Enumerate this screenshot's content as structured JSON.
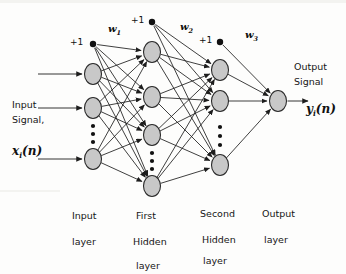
{
  "diagram": {
    "background_color": "#fdfdfc",
    "node_fill": "#c8c8c8",
    "node_stroke": "#2b2b2b",
    "edge_color": "#1d1d1d"
  },
  "signals": {
    "input_line1": "Input",
    "input_line2": "Signal,",
    "input_math": "x",
    "input_math_sub": "i",
    "input_math_tail": "(n)",
    "output_line1": "Output",
    "output_line2": "Signal",
    "output_math": "y",
    "output_math_sub": "i",
    "output_math_tail": "(n)"
  },
  "bias": {
    "input_layer": "+1",
    "first_hidden_layer": "+1",
    "second_hidden_layer": "+1"
  },
  "weights": [
    {
      "name": "w",
      "sub": "1"
    },
    {
      "name": "w",
      "sub": "2"
    },
    {
      "name": "w",
      "sub": "3"
    }
  ],
  "layer_captions": [
    {
      "line1": "Input",
      "line2": "layer",
      "line3": ""
    },
    {
      "line1": "First",
      "line2": "Hidden",
      "line3": "layer"
    },
    {
      "line1": "Second",
      "line2": "Hidden",
      "line3": "layer"
    },
    {
      "line1": "Output",
      "line2": "layer",
      "line3": ""
    }
  ],
  "layers": [
    {
      "id": "input-layer",
      "x": 93,
      "node_count": 3,
      "node_y": [
        74,
        108,
        159
      ],
      "bias_y": 44,
      "ellipsis_y": [
        126,
        134,
        142
      ],
      "has_bias": true
    },
    {
      "id": "first-hidden-layer",
      "x": 152,
      "node_count": 4,
      "node_y": [
        52,
        97,
        135,
        186
      ],
      "bias_y": 22,
      "ellipsis_y": [
        153,
        161,
        169
      ],
      "has_bias": true
    },
    {
      "id": "second-hidden-layer",
      "x": 220,
      "node_count": 3,
      "node_y": [
        70,
        101,
        165
      ],
      "bias_y": 42,
      "ellipsis_y": [
        127,
        136,
        145
      ],
      "has_bias": true
    },
    {
      "id": "output-layer",
      "x": 278,
      "node_count": 1,
      "node_y": [
        101
      ],
      "has_bias": false
    }
  ]
}
